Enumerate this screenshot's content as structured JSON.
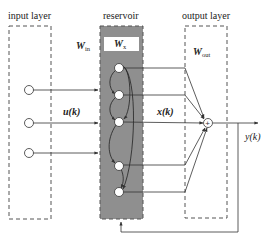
{
  "diagram": {
    "type": "echo-state-network",
    "layers": {
      "input": {
        "label": "input layer"
      },
      "reservoir": {
        "label": "reservoir"
      },
      "output": {
        "label": "output layer"
      }
    },
    "weights": {
      "input": {
        "symbol": "W",
        "subscript": "in"
      },
      "reservoir": {
        "symbol": "W",
        "subscript": "x"
      },
      "output": {
        "symbol": "W",
        "subscript": "out"
      }
    },
    "signals": {
      "input": "u(k)",
      "state": "x(k)",
      "output": "y(k)"
    },
    "summation_symbol": "+",
    "colors": {
      "reservoir_fill": "#8f8f8f",
      "stroke": "#333333",
      "dash": "#555555"
    },
    "input_nodes": 3,
    "reservoir_nodes": 5
  }
}
